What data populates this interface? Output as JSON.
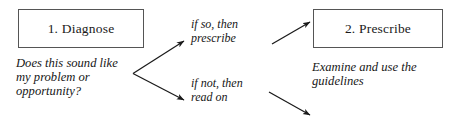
{
  "diagram": {
    "type": "flowchart",
    "background_color": "#ffffff",
    "text_color": "#161616",
    "box_border_color": "#555555",
    "arrow_color": "#1a1a1a",
    "nodes": [
      {
        "id": "diagnose",
        "label": "1. Diagnose",
        "caption": "Does this sound like\nmy problem or\nopportunity?"
      },
      {
        "id": "prescribe",
        "label": "2. Prescribe",
        "caption": "Examine and use the\nguidelines"
      }
    ],
    "edges": [
      {
        "id": "branch-yes",
        "label": "if so, then\nprescribe",
        "from": "diagnose",
        "to": "prescribe"
      },
      {
        "id": "branch-no",
        "label": "if not, then\nread on",
        "from": "diagnose",
        "to": "continue"
      }
    ]
  }
}
